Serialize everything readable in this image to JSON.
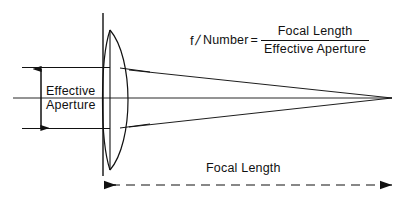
{
  "diagram": {
    "stroke_color": "#111111",
    "background_color": "#ffffff"
  },
  "formula": {
    "f_symbol": "f",
    "slash": "/",
    "number_word": "Number",
    "equals": "=",
    "numerator": "Focal  Length",
    "denominator": "Effective Aperture"
  },
  "labels": {
    "effective_line1": "Effective",
    "effective_line2": "Aperture",
    "focal_length": "Focal  Length"
  },
  "geometry": {
    "lens_center_x": 117,
    "optical_axis_y": 98,
    "lens_top_y": 30,
    "lens_bottom_y": 170,
    "focal_point_x": 392,
    "focal_point_y": 98,
    "aperture_top_y": 67,
    "aperture_bottom_y": 128,
    "aperture_arrow_x": 41,
    "focal_dim_y": 185,
    "focal_dim_start_x": 103,
    "focal_dim_end_x": 392,
    "ray_start_x": 22,
    "stop_bar_x": 103
  }
}
